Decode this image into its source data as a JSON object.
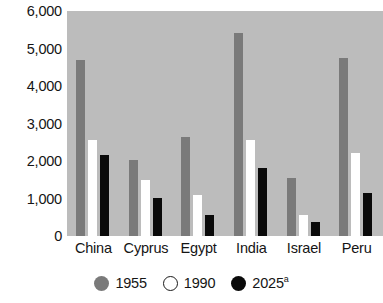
{
  "chart_data": {
    "type": "bar",
    "title": "",
    "title_fragment": "· · ·",
    "xlabel": "",
    "ylabel": "",
    "ylim": [
      0,
      6000
    ],
    "yticks": [
      6000,
      5000,
      4000,
      3000,
      2000,
      1000,
      0
    ],
    "ytick_labels": [
      "6,000",
      "5,000",
      "4,000",
      "3,000",
      "2,000",
      "1,000",
      "0"
    ],
    "grid": false,
    "legend_position": "bottom",
    "plot_background": "#bcbcbc",
    "categories": [
      "China",
      "Cyprus",
      "Egypt",
      "India",
      "Israel",
      "Peru"
    ],
    "series": [
      {
        "name": "1955",
        "color": "#7a7a7a",
        "values": [
          4700,
          2030,
          2650,
          5420,
          1550,
          4740
        ]
      },
      {
        "name": "1990",
        "color": "#ffffff",
        "values": [
          2550,
          1500,
          1100,
          2550,
          560,
          2220
        ]
      },
      {
        "name": "2025",
        "name_suffix": "a",
        "color": "#0a0a0a",
        "values": [
          2160,
          1010,
          570,
          1820,
          370,
          1140
        ]
      }
    ]
  },
  "legend": {
    "entries": [
      {
        "label": "1955",
        "suffix": "",
        "swatch": "filled-gray-circle-icon"
      },
      {
        "label": "1990",
        "suffix": "",
        "swatch": "outlined-white-circle-icon"
      },
      {
        "label": "2025",
        "suffix": "a",
        "swatch": "filled-black-circle-icon"
      }
    ]
  }
}
